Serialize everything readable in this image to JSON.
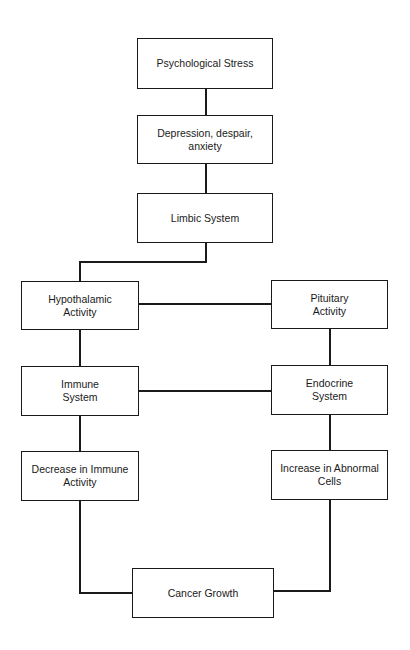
{
  "diagram": {
    "type": "flowchart",
    "nodes": [
      {
        "id": "stress",
        "label": "Psychological Stress"
      },
      {
        "id": "depression",
        "label": "Depression, despair, anxiety"
      },
      {
        "id": "limbic",
        "label": "Limbic System"
      },
      {
        "id": "hypothalamic",
        "label": "Hypothalamic Activity"
      },
      {
        "id": "pituitary",
        "label": "Pituitary Activity"
      },
      {
        "id": "immune",
        "label": "Immune System"
      },
      {
        "id": "endocrine",
        "label": "Endocrine System"
      },
      {
        "id": "decrease",
        "label": "Decrease in Immune Activity"
      },
      {
        "id": "increase",
        "label": "Increase in Abnormal Cells"
      },
      {
        "id": "cancer",
        "label": "Cancer Growth"
      }
    ],
    "edges": [
      [
        "stress",
        "depression"
      ],
      [
        "depression",
        "limbic"
      ],
      [
        "limbic",
        "hypothalamic"
      ],
      [
        "hypothalamic",
        "pituitary"
      ],
      [
        "hypothalamic",
        "immune"
      ],
      [
        "pituitary",
        "endocrine"
      ],
      [
        "immune",
        "endocrine"
      ],
      [
        "immune",
        "decrease"
      ],
      [
        "endocrine",
        "increase"
      ],
      [
        "decrease",
        "cancer"
      ],
      [
        "increase",
        "cancer"
      ]
    ]
  }
}
